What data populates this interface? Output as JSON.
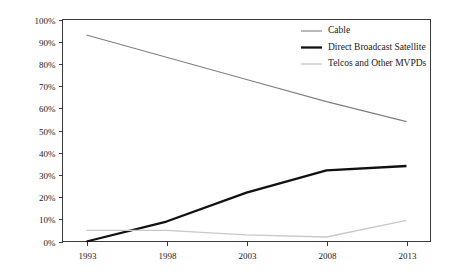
{
  "chart_data": {
    "type": "line",
    "title": "",
    "subtitle": "",
    "xlabel": "",
    "ylabel": "",
    "x": [
      1993,
      1998,
      2003,
      2008,
      2013
    ],
    "categories": [
      "1993",
      "1998",
      "2003",
      "2008",
      "2013"
    ],
    "xtick_labels": [
      "1993",
      "1998",
      "2003",
      "2008",
      "2013"
    ],
    "ytick_labels": [
      "0%",
      "10%",
      "20%",
      "30%",
      "40%",
      "50%",
      "60%",
      "70%",
      "80%",
      "90%",
      "100%"
    ],
    "ytick_values": [
      0,
      10,
      20,
      30,
      40,
      50,
      60,
      70,
      80,
      90,
      100
    ],
    "xlim": [
      1991.5,
      2014.5
    ],
    "ylim": [
      0,
      100
    ],
    "grid": false,
    "frame": true,
    "legend_position": "top-right",
    "series": [
      {
        "name": "Cable",
        "color": "#808080",
        "width": 1.1,
        "values": [
          93,
          83,
          73,
          63,
          54
        ]
      },
      {
        "name": "Direct Broadcast Satellite",
        "color": "#111111",
        "width": 2.3,
        "values": [
          0,
          9,
          22,
          32,
          34
        ]
      },
      {
        "name": "Telcos and Other MVPDs",
        "color": "#c8c8c8",
        "width": 1.4,
        "values": [
          5,
          5,
          3,
          2,
          9.5
        ]
      }
    ]
  },
  "legend": {
    "entries": [
      {
        "label": "Cable"
      },
      {
        "label": "Direct Broadcast Satellite"
      },
      {
        "label": "Telcos and Other MVPDs"
      }
    ]
  },
  "colors": {
    "background": "#ffffff",
    "axis": "#3a3a3a",
    "text": "#1a1a1a",
    "cable": "#808080",
    "dbs": "#111111",
    "telcos": "#c8c8c8"
  }
}
